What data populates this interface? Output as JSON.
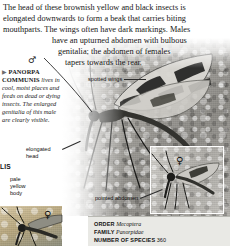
{
  "article": {
    "body_lines": [
      "The head of these brownish yellow and black insects is",
      "elongated downwards to form a beak that carries biting",
      "mouthparts. The wings often have dark markings. Males",
      "have an upturned abdomen with bulbous",
      "genitalia; the abdomen of females",
      "tapers towards the rear."
    ]
  },
  "caption": {
    "bullet": "▶",
    "species_name": "PANORPA COMMUNIS",
    "text": " lives in cool, moist places and feeds on dead or dying insects. The enlarged genitalia of this male are clearly visible."
  },
  "labels": {
    "spotted_wings": "spotted wings",
    "elongated_head": "elongated head",
    "pale_yellow_body": "pale yellow body",
    "pointed_abdomen": "pointed abdomen"
  },
  "symbols": {
    "male": "♂",
    "female": "♀"
  },
  "partial_text": {
    "cut_off_left": "LIS"
  },
  "infobox": {
    "rows": [
      {
        "key": "ORDER",
        "value": "Mecoptera",
        "italic": true
      },
      {
        "key": "FAMILY",
        "value": "Panorpidae",
        "italic": true
      },
      {
        "key": "NUMBER OF SPECIES",
        "value": "360",
        "italic": false
      }
    ]
  },
  "colors": {
    "text": "#151515",
    "infobox_bg": "#e9e9e5",
    "infobox_rule": "#b9b9b3",
    "leader": "#2b2b2b"
  }
}
